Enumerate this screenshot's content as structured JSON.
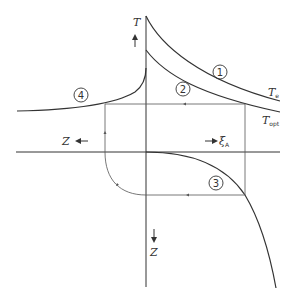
{
  "diagram": {
    "axes": {
      "vertical_up": {
        "label": "T"
      },
      "horizontal_right": {
        "label": "ξ",
        "subscript": "A"
      },
      "horizontal_left": {
        "label": "Z"
      },
      "vertical_down": {
        "label": "Z"
      }
    },
    "curves": [
      {
        "id": "1",
        "label": "1",
        "end_label": "T",
        "end_subscript": "e",
        "meaning": "equilibrium temperature curve"
      },
      {
        "id": "2",
        "label": "2",
        "end_label": "T",
        "end_subscript": "opt",
        "meaning": "optimum temperature curve"
      },
      {
        "id": "3",
        "label": "3",
        "meaning": "xi_A vs Z mapping"
      },
      {
        "id": "4",
        "label": "4",
        "meaning": "T vs Z profile"
      }
    ],
    "caption_fragment": ""
  },
  "colors": {
    "line": "#333333",
    "construction_line": "#555555",
    "background": "#ffffff"
  }
}
